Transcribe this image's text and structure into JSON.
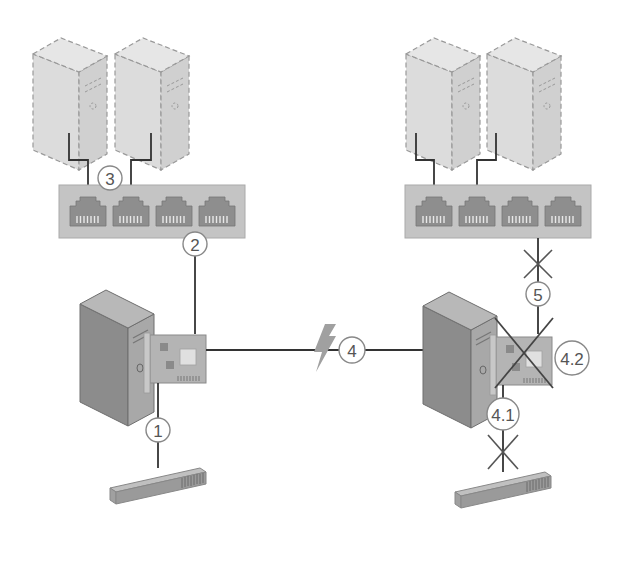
{
  "diagram": {
    "colors": {
      "background": "#ffffff",
      "ghost_server_fill": "#dcdcdc",
      "ghost_server_stroke": "#999999",
      "switch_fill": "#c4c4c4",
      "port_fill": "#8e8e8e",
      "server_front": "#8c8c8c",
      "server_side": "#a8a8a8",
      "server_top": "#b8b8b8",
      "nic_fill": "#b4b4b4",
      "cable": "#333333",
      "badge_stroke": "#888888",
      "badge_text": "#555555",
      "lightning": "#a0a0a0",
      "cross": "#555555"
    },
    "left_site": {
      "ghost_servers": [
        {
          "name": "left-ghost-server-1"
        },
        {
          "name": "left-ghost-server-2"
        }
      ],
      "switch": {
        "port_count": 4
      },
      "server": {
        "name": "left-server"
      },
      "nic": {
        "name": "left-nic"
      },
      "bottom_device": {
        "name": "left-bottom-device"
      }
    },
    "right_site": {
      "ghost_servers": [
        {
          "name": "right-ghost-server-1"
        },
        {
          "name": "right-ghost-server-2"
        }
      ],
      "switch": {
        "port_count": 4
      },
      "server": {
        "name": "right-server"
      },
      "nic": {
        "name": "right-nic",
        "crossed_out": true
      },
      "bottom_device": {
        "name": "right-bottom-device"
      }
    },
    "step_labels": {
      "one": "1",
      "two": "2",
      "three": "3",
      "four": "4",
      "four_one": "4.1",
      "four_two": "4.2",
      "five": "5"
    },
    "icons": {
      "wireless_link": "lightning-bolt-icon",
      "disconnected": "cross-icon"
    }
  }
}
